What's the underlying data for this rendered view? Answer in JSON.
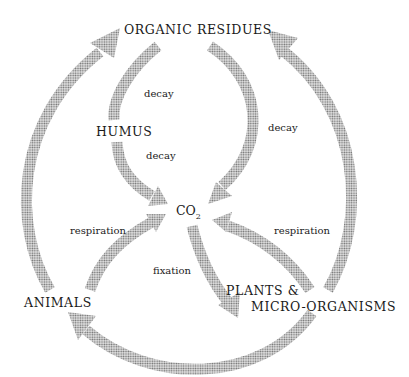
{
  "diagram": {
    "type": "carbon cycle",
    "nodes": {
      "organic_residues": "ORGANIC RESIDUES",
      "humus": "HUMUS",
      "co2_main": "CO",
      "co2_sub": "2",
      "animals": "ANIMALS",
      "plants_line1": "PLANTS &",
      "plants_line2": "MICRO-ORGANISMS"
    },
    "processes": {
      "decay_residues_to_humus": "decay",
      "decay_humus_to_co2": "decay",
      "decay_residues_to_co2": "decay",
      "respiration_animals": "respiration",
      "respiration_plants": "respiration",
      "fixation": "fixation"
    },
    "edges": [
      {
        "from": "ORGANIC RESIDUES",
        "to": "HUMUS",
        "label": "decay"
      },
      {
        "from": "HUMUS",
        "to": "CO2",
        "label": "decay"
      },
      {
        "from": "ORGANIC RESIDUES",
        "to": "CO2",
        "label": "decay"
      },
      {
        "from": "ANIMALS",
        "to": "CO2",
        "label": "respiration"
      },
      {
        "from": "PLANTS & MICRO-ORGANISMS",
        "to": "CO2",
        "label": "respiration"
      },
      {
        "from": "CO2",
        "to": "PLANTS & MICRO-ORGANISMS",
        "label": "fixation"
      },
      {
        "from": "ANIMALS",
        "to": "ORGANIC RESIDUES",
        "label": ""
      },
      {
        "from": "PLANTS & MICRO-ORGANISMS",
        "to": "ORGANIC RESIDUES",
        "label": ""
      },
      {
        "from": "PLANTS & MICRO-ORGANISMS",
        "to": "ANIMALS",
        "label": ""
      }
    ],
    "colors": {
      "arrow": "#9a9a9a",
      "text": "#1a1a1a",
      "background": "#ffffff"
    }
  }
}
